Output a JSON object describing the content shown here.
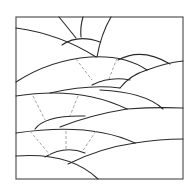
{
  "artwork": {
    "title": "Rolling hills with rising suns line drawing",
    "style": "outline coloring page",
    "colors": {
      "background": "#ffffff",
      "line": "#2a2a2a",
      "dashed_line": "#9a9a9a",
      "frame": "#555555"
    },
    "frame": {
      "x": 16,
      "y": 17,
      "width": 167,
      "height": 162
    },
    "elements": {
      "suns": [
        "sun-top",
        "sun-middle",
        "sun-small",
        "sun-bottom"
      ],
      "hills_count": 10,
      "ray_groups": [
        "solid rays (top sun)",
        "dashed rays (lower suns)"
      ]
    }
  }
}
